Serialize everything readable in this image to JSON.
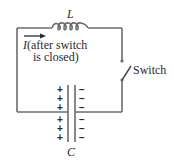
{
  "diagram": {
    "type": "LC circuit",
    "inductor": {
      "label": "L"
    },
    "capacitor": {
      "label": "C",
      "left_plate_charges": [
        "+",
        "+",
        "+",
        "+",
        "+",
        "+"
      ],
      "right_plate_charges": [
        "−",
        "−",
        "−",
        "−",
        "−",
        "−"
      ]
    },
    "current_annotation": {
      "symbol": "I",
      "line1_rest": "(after switch",
      "line2": "is closed)"
    },
    "switch": {
      "label": "Switch",
      "state": "open"
    },
    "colors": {
      "wire": "#6b6b6b",
      "text": "#2a2a2a",
      "background": "#ffffff"
    }
  }
}
